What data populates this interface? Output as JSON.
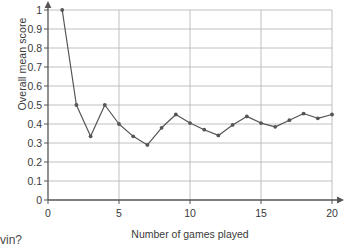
{
  "chart_data": {
    "type": "line",
    "title": "",
    "xlabel": "Number of games played",
    "ylabel": "Overall mean score",
    "xlim": [
      0,
      20
    ],
    "ylim": [
      0,
      1
    ],
    "grid": true,
    "legend": "none",
    "marker": "filled-circle",
    "line_color": "#555555",
    "grid_color": "#b9b9b9",
    "axis_color": "#555555",
    "x": [
      1,
      2,
      3,
      4,
      5,
      6,
      7,
      8,
      9,
      10,
      11,
      12,
      13,
      14,
      15,
      16,
      17,
      18,
      19,
      20
    ],
    "values": [
      1.0,
      0.5,
      0.335,
      0.5,
      0.4,
      0.335,
      0.29,
      0.38,
      0.45,
      0.405,
      0.37,
      0.34,
      0.395,
      0.44,
      0.405,
      0.385,
      0.42,
      0.455,
      0.43,
      0.45
    ],
    "xticks": [
      0,
      5,
      10,
      15,
      20
    ],
    "xtick_labels": [
      "0",
      "5",
      "10",
      "15",
      "20"
    ],
    "yticks": [
      0,
      0.1,
      0.2,
      0.3,
      0.4,
      0.5,
      0.6,
      0.7,
      0.8,
      0.9,
      1
    ],
    "ytick_labels": [
      "0",
      "0.1",
      "0.2",
      "0.3",
      "0.4",
      "0.5",
      "0.6",
      "0.7",
      "0.8",
      "0.9",
      "1"
    ]
  },
  "page": {
    "caption_fragment": "vin?"
  }
}
